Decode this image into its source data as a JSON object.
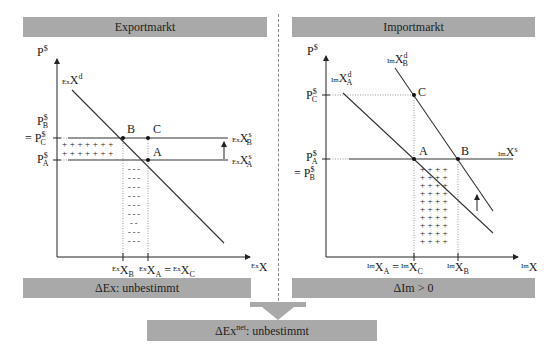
{
  "panels": {
    "export": {
      "title": "Exportmarkt",
      "y_axis_label": "P",
      "y_axis_label_sup": "$",
      "x_axis_label_pre": "Ex",
      "x_axis_label": "X",
      "demand_label": {
        "pre": "Ex",
        "main": "X",
        "sup": "d"
      },
      "supply_labels": [
        {
          "pre": "Ex",
          "main": "X",
          "sup": "s",
          "sub": "B"
        },
        {
          "pre": "Ex",
          "main": "X",
          "sup": "s",
          "sub": "A"
        }
      ],
      "price_labels": [
        {
          "prefix": "",
          "main": "P",
          "sup": "$",
          "sub": "B"
        },
        {
          "prefix": "= ",
          "main": "P",
          "sup": "$",
          "sub": "C"
        },
        {
          "prefix": "",
          "main": "P",
          "sup": "$",
          "sub": "A"
        }
      ],
      "x_tick_labels": [
        {
          "pre": "Ex",
          "main": "X",
          "sub": "B"
        },
        {
          "pre": "Ex",
          "main": "X",
          "sub": "A",
          "eq": "=",
          "pre2": "Ex",
          "main2": "X",
          "sub2": "C"
        }
      ],
      "points": [
        "A",
        "B",
        "C"
      ],
      "plus_sign": "+",
      "minus_sign": "- - -",
      "minus_short": "- -",
      "result": "ΔEx: unbestimmt"
    },
    "import": {
      "title": "Importmarkt",
      "y_axis_label": "P",
      "y_axis_label_sup": "$",
      "x_axis_label_pre": "Im",
      "x_axis_label": "X",
      "demand_labels": [
        {
          "pre": "Im",
          "main": "X",
          "sup": "d",
          "sub": "A"
        },
        {
          "pre": "Im",
          "main": "X",
          "sup": "d",
          "sub": "B"
        }
      ],
      "supply_label": {
        "pre": "Im",
        "main": "X",
        "sup": "s"
      },
      "price_labels": [
        {
          "prefix": "",
          "main": "P",
          "sup": "$",
          "sub": "C"
        },
        {
          "prefix": "",
          "main": "P",
          "sup": "$",
          "sub": "A"
        },
        {
          "prefix": "= ",
          "main": "P",
          "sup": "$",
          "sub": "B"
        }
      ],
      "x_tick_labels": [
        {
          "pre": "Im",
          "main": "X",
          "sub": "A",
          "eq": "=",
          "pre2": "Im",
          "main2": "X",
          "sub2": "C"
        },
        {
          "pre": "Im",
          "main": "X",
          "sub": "B"
        }
      ],
      "points": [
        "A",
        "B",
        "C"
      ],
      "plus_sign": "+",
      "result_main": "ΔIm",
      "result_rel": " > 0"
    }
  },
  "summary": {
    "main": "ΔEx",
    "sup": "net",
    "rest": ": unbestimmt"
  },
  "colors": {
    "bar_fill": "#a9a9a9",
    "line": "#333333",
    "guide": "#9a9a9a"
  }
}
